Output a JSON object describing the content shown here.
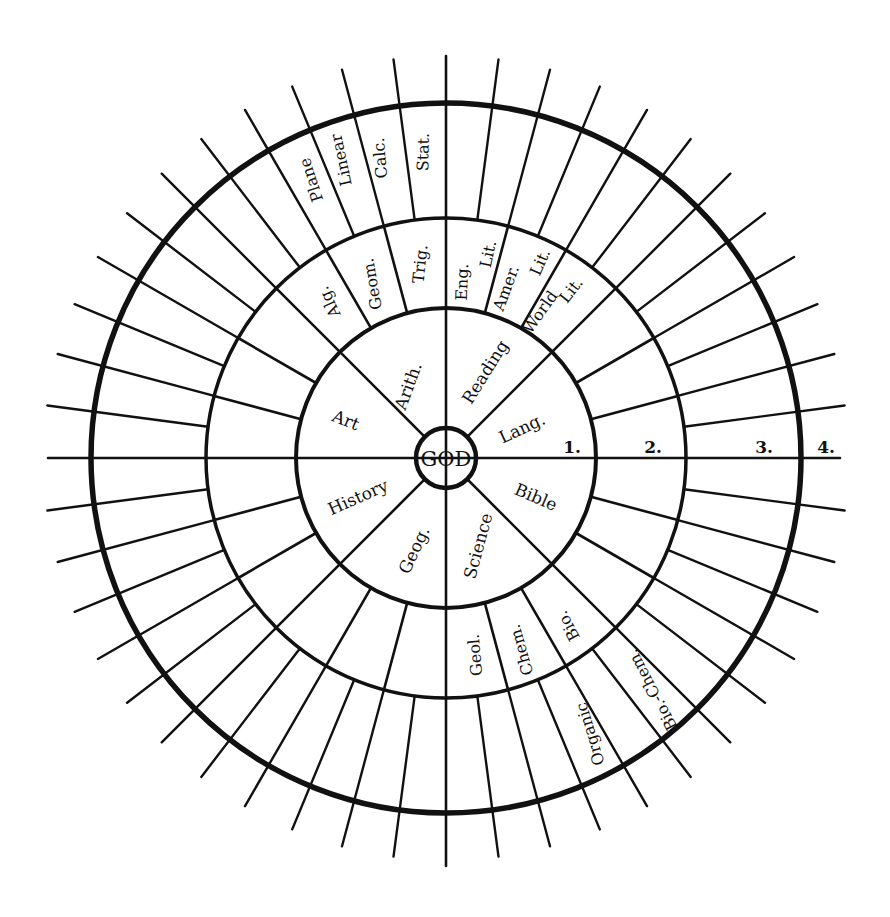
{
  "diagram": {
    "center": {
      "x": 446,
      "y": 458
    },
    "ink_color": "#111111",
    "background": "#ffffff",
    "core": {
      "label": "GOD",
      "radius": 30
    },
    "rings": [
      {
        "name": "ring-1",
        "radius": 150,
        "stroke": 4
      },
      {
        "name": "ring-2",
        "radius": 240,
        "stroke": 3.5
      },
      {
        "name": "ring-3",
        "radius": 355,
        "stroke": 5.5
      }
    ],
    "axes": {
      "horizontal": {
        "x1": 48,
        "x2": 840,
        "y": 458
      },
      "vertical": {
        "x": 446,
        "y1": 56,
        "y2": 866
      }
    },
    "ring_numbers": [
      {
        "label": "1.",
        "x": 572,
        "y": 447
      },
      {
        "label": "2.",
        "x": 653,
        "y": 447
      },
      {
        "label": "3.",
        "x": 764,
        "y": 447
      },
      {
        "label": "4.",
        "x": 826,
        "y": 447
      }
    ],
    "spokes": {
      "inner": {
        "r_from": 30,
        "r_to": 150,
        "angles": [
          45,
          135,
          225,
          315
        ]
      },
      "middle": {
        "r_from": 150,
        "r_to": 240,
        "angles": [
          15,
          30,
          45,
          60,
          75,
          105,
          120,
          135,
          150,
          165,
          195,
          210,
          225,
          240,
          255,
          285,
          300,
          315,
          330,
          345
        ]
      },
      "outer": {
        "r_from": 240,
        "r_to": 402,
        "angles": [
          7.5,
          15,
          22.5,
          30,
          37.5,
          45,
          52.5,
          60,
          67.5,
          75,
          82.5,
          97.5,
          105,
          112.5,
          120,
          127.5,
          135,
          142.5,
          150,
          157.5,
          165,
          172.5,
          187.5,
          195,
          202.5,
          210,
          217.5,
          225,
          232.5,
          240,
          247.5,
          255,
          262.5,
          277.5,
          285,
          292.5,
          300,
          307.5,
          315,
          322.5,
          330,
          337.5,
          345,
          352.5
        ]
      }
    },
    "subjects_level_1": [
      {
        "label": "Art",
        "x": 346,
        "y": 420,
        "rot": 22,
        "size": 17
      },
      {
        "label": "Arith.",
        "x": 408,
        "y": 386,
        "rot": -70,
        "size": 17
      },
      {
        "label": "Reading",
        "x": 485,
        "y": 372,
        "rot": -58,
        "size": 17
      },
      {
        "label": "Lang.",
        "x": 522,
        "y": 428,
        "rot": -25,
        "size": 17
      },
      {
        "label": "History",
        "x": 358,
        "y": 497,
        "rot": -24,
        "size": 17
      },
      {
        "label": "Geog.",
        "x": 414,
        "y": 550,
        "rot": -65,
        "size": 17
      },
      {
        "label": "Science",
        "x": 478,
        "y": 546,
        "rot": -75,
        "size": 17
      },
      {
        "label": "Bible",
        "x": 536,
        "y": 497,
        "rot": 23,
        "size": 17
      }
    ],
    "subjects_level_2": [
      {
        "label": "Alg.",
        "x": 329,
        "y": 302,
        "rot": -115,
        "size": 16
      },
      {
        "label": "Geom.",
        "x": 372,
        "y": 284,
        "rot": -100,
        "size": 16
      },
      {
        "label": "Trig.",
        "x": 420,
        "y": 264,
        "rot": -84,
        "size": 16
      },
      {
        "label": "Eng.",
        "x": 462,
        "y": 282,
        "rot": -88,
        "size": 16
      },
      {
        "label": "Lit.",
        "x": 488,
        "y": 254,
        "rot": -78,
        "size": 16
      },
      {
        "label": "Amer.",
        "x": 506,
        "y": 288,
        "rot": -70,
        "size": 16
      },
      {
        "label": "Lit.",
        "x": 540,
        "y": 262,
        "rot": -66,
        "size": 16
      },
      {
        "label": "World",
        "x": 540,
        "y": 312,
        "rot": -55,
        "size": 16
      },
      {
        "label": "Lit.",
        "x": 571,
        "y": 290,
        "rot": -52,
        "size": 16
      },
      {
        "label": "Geol.",
        "x": 475,
        "y": 655,
        "rot": -95,
        "size": 16
      },
      {
        "label": "Chem.",
        "x": 521,
        "y": 650,
        "rot": -106,
        "size": 16
      },
      {
        "label": "Bio.",
        "x": 568,
        "y": 626,
        "rot": -118,
        "size": 16
      }
    ],
    "subjects_level_3": [
      {
        "label": "Plane",
        "x": 311,
        "y": 180,
        "rot": -108,
        "size": 16
      },
      {
        "label": "Linear",
        "x": 341,
        "y": 160,
        "rot": -102,
        "size": 16
      },
      {
        "label": "Calc.",
        "x": 380,
        "y": 158,
        "rot": -95,
        "size": 16
      },
      {
        "label": "Stat.",
        "x": 423,
        "y": 152,
        "rot": -89,
        "size": 16
      },
      {
        "label": "Organic",
        "x": 590,
        "y": 734,
        "rot": -107,
        "size": 16
      },
      {
        "label": "Bio.-Chem.",
        "x": 652,
        "y": 690,
        "rot": -118,
        "size": 16
      }
    ]
  }
}
